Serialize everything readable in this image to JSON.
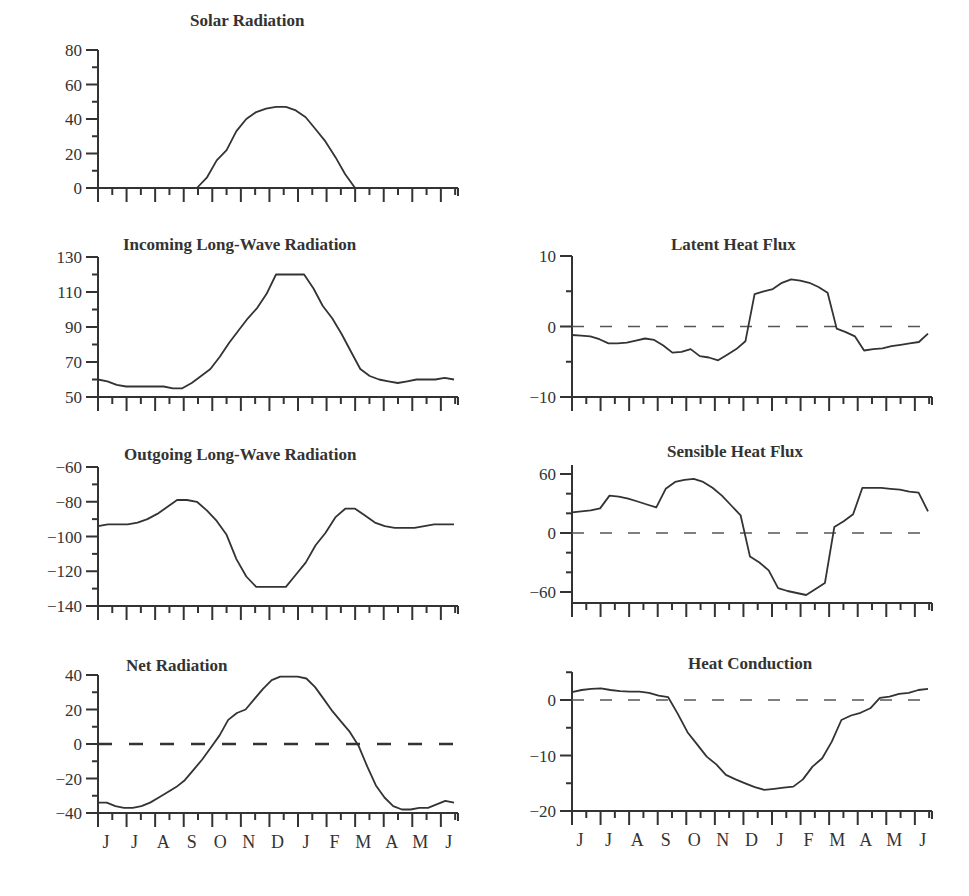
{
  "figure": {
    "x_months": [
      "J",
      "J",
      "A",
      "S",
      "O",
      "N",
      "D",
      "J",
      "F",
      "M",
      "A",
      "M",
      "J"
    ]
  },
  "chart_data": [
    {
      "id": "solar",
      "type": "line",
      "title": "Solar Radiation",
      "xlabel": "",
      "ylabel": "",
      "categories": [
        "J",
        "J",
        "A",
        "S",
        "O",
        "N",
        "D",
        "J",
        "F",
        "M",
        "A",
        "M",
        "J"
      ],
      "ylim": [
        0,
        80
      ],
      "yticks": [
        0,
        20,
        40,
        60,
        80
      ],
      "minor_step": 10,
      "zero_line": false,
      "values": [
        0,
        0,
        0,
        0,
        0,
        0,
        0,
        0,
        0,
        0,
        0,
        6,
        16,
        22,
        33,
        40,
        44,
        46,
        47,
        47,
        45,
        41,
        34,
        27,
        18,
        8,
        0,
        0,
        0,
        0,
        0,
        0,
        0,
        0,
        0,
        0,
        0
      ],
      "grid": false
    },
    {
      "id": "incoming_lw",
      "type": "line",
      "title": "Incoming Long-Wave Radiation",
      "categories": [
        "J",
        "J",
        "A",
        "S",
        "O",
        "N",
        "D",
        "J",
        "F",
        "M",
        "A",
        "M",
        "J"
      ],
      "ylim": [
        50,
        130
      ],
      "yticks": [
        50,
        70,
        90,
        110,
        130
      ],
      "minor_step": 10,
      "zero_line": false,
      "values": [
        60,
        59,
        57,
        56,
        56,
        56,
        56,
        56,
        55,
        55,
        58,
        62,
        66,
        73,
        81,
        88,
        95,
        101,
        109,
        120,
        120,
        120,
        120,
        112,
        102,
        95,
        86,
        76,
        66,
        62,
        60,
        59,
        58,
        59,
        60,
        60,
        60,
        61,
        60
      ]
    },
    {
      "id": "outgoing_lw",
      "type": "line",
      "title": "Outgoing Long-Wave Radiation",
      "categories": [
        "J",
        "J",
        "A",
        "S",
        "O",
        "N",
        "D",
        "J",
        "F",
        "M",
        "A",
        "M",
        "J"
      ],
      "ylim": [
        -140,
        -60
      ],
      "yticks": [
        -140,
        -120,
        -100,
        -80,
        -60
      ],
      "minor_step": 10,
      "zero_line": false,
      "values": [
        -94,
        -93,
        -93,
        -93,
        -92,
        -90,
        -87,
        -83,
        -79,
        -79,
        -80,
        -85,
        -91,
        -99,
        -113,
        -123,
        -129,
        -129,
        -129,
        -129,
        -122,
        -115,
        -105,
        -98,
        -89,
        -84,
        -84,
        -88,
        -92,
        -94,
        -95,
        -95,
        -95,
        -94,
        -93,
        -93,
        -93
      ]
    },
    {
      "id": "net_radiation",
      "type": "line",
      "title": "Net Radiation",
      "categories": [
        "J",
        "J",
        "A",
        "S",
        "O",
        "N",
        "D",
        "J",
        "F",
        "M",
        "A",
        "M",
        "J"
      ],
      "ylim": [
        -40,
        40
      ],
      "yticks": [
        -40,
        -20,
        0,
        20,
        40
      ],
      "minor_step": 10,
      "zero_line": true,
      "zero_line_bold": true,
      "values": [
        -34,
        -34,
        -36,
        -37,
        -37,
        -36,
        -34,
        -31,
        -28,
        -25,
        -21,
        -15,
        -9,
        -2,
        5,
        14,
        18,
        20,
        26,
        32,
        37,
        39,
        39,
        39,
        38,
        33,
        26,
        19,
        13,
        7,
        -1,
        -13,
        -24,
        -31,
        -36,
        -38,
        -38,
        -37,
        -37,
        -35,
        -33,
        -34
      ]
    },
    {
      "id": "latent_heat",
      "type": "line",
      "title": "Latent Heat Flux",
      "categories": [
        "J",
        "J",
        "A",
        "S",
        "O",
        "N",
        "D",
        "J",
        "F",
        "M",
        "A",
        "M",
        "J"
      ],
      "ylim": [
        -10,
        10
      ],
      "yticks": [
        -10,
        0,
        10
      ],
      "minor_step": 5,
      "zero_line": true,
      "values": [
        -1.2,
        -1.3,
        -1.4,
        -1.8,
        -2.4,
        -2.4,
        -2.3,
        -2.0,
        -1.7,
        -1.9,
        -2.7,
        -3.7,
        -3.6,
        -3.2,
        -4.2,
        -4.4,
        -4.8,
        -4.0,
        -3.2,
        -2.1,
        4.6,
        5.0,
        5.3,
        6.2,
        6.7,
        6.5,
        6.2,
        5.6,
        4.8,
        -0.3,
        -0.8,
        -1.4,
        -3.4,
        -3.2,
        -3.1,
        -2.8,
        -2.6,
        -2.4,
        -2.2,
        -1.0
      ]
    },
    {
      "id": "sensible_heat",
      "type": "line",
      "title": "Sensible Heat Flux",
      "categories": [
        "J",
        "J",
        "A",
        "S",
        "O",
        "N",
        "D",
        "J",
        "F",
        "M",
        "A",
        "M",
        "J"
      ],
      "ylim": [
        -60,
        60
      ],
      "yticks": [
        -60,
        0,
        60
      ],
      "minor_step": 20,
      "zero_line": true,
      "values": [
        21,
        22,
        23,
        25,
        38,
        37,
        35,
        32,
        29,
        26,
        45,
        52,
        54,
        55,
        52,
        46,
        38,
        28,
        18,
        -24,
        -30,
        -38,
        -56,
        -59,
        -61,
        -63,
        -57,
        -51,
        6,
        12,
        19,
        46,
        46,
        46,
        45,
        44,
        42,
        41,
        22
      ]
    },
    {
      "id": "heat_conduction",
      "type": "line",
      "title": "Heat Conduction",
      "categories": [
        "J",
        "J",
        "A",
        "S",
        "O",
        "N",
        "D",
        "J",
        "F",
        "M",
        "A",
        "M",
        "J"
      ],
      "ylim": [
        -20,
        5
      ],
      "yticks": [
        -20,
        -10,
        0
      ],
      "minor_step": 5,
      "zero_line": true,
      "values": [
        1.4,
        1.8,
        2.0,
        2.1,
        1.8,
        1.6,
        1.5,
        1.5,
        1.3,
        0.8,
        0.5,
        -2.5,
        -5.8,
        -8.0,
        -10.2,
        -11.6,
        -13.5,
        -14.3,
        -15.0,
        -15.7,
        -16.2,
        -16.0,
        -15.8,
        -15.6,
        -14.3,
        -12.0,
        -10.5,
        -7.5,
        -3.6,
        -2.8,
        -2.3,
        -1.5,
        0.4,
        0.6,
        1.1,
        1.3,
        1.8,
        2.0
      ]
    }
  ],
  "layout": {
    "left_x0": 98,
    "left_x1": 458,
    "right_x0": 572,
    "right_x1": 932
  }
}
